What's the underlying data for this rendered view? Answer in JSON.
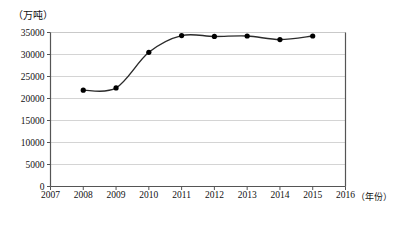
{
  "chart_data": {
    "type": "line",
    "title": "",
    "xlabel": "（年份）",
    "ylabel": "（万吨）",
    "x": [
      2008,
      2009,
      2010,
      2011,
      2012,
      2013,
      2014,
      2015
    ],
    "values": [
      21900,
      22400,
      30500,
      34300,
      34100,
      34200,
      33400,
      34200
    ],
    "series": [
      {
        "name": "产量",
        "values": [
          21900,
          22400,
          30500,
          34300,
          34100,
          34200,
          33400,
          34200
        ]
      }
    ],
    "xlim": [
      2007,
      2016
    ],
    "ylim": [
      0,
      35000
    ],
    "xticks": [
      2007,
      2008,
      2009,
      2010,
      2011,
      2012,
      2013,
      2014,
      2015,
      2016
    ],
    "xtick_labels": [
      "2007",
      "2008",
      "2009",
      "2010",
      "2011",
      "2012",
      "2013",
      "2014",
      "2015",
      "2016"
    ],
    "yticks": [
      0,
      5000,
      10000,
      15000,
      20000,
      25000,
      30000,
      35000
    ],
    "ytick_labels": [
      "0",
      "5000",
      "10000",
      "15000",
      "20000",
      "25000",
      "30000",
      "35000"
    ],
    "grid": "horizontal",
    "legend": "none",
    "marker": "filled-circle",
    "line_color": "#2b2b2b",
    "marker_color": "#000000",
    "grid_color": "#c9c9c9",
    "axis_color": "#555555",
    "smoothing": "spline"
  }
}
